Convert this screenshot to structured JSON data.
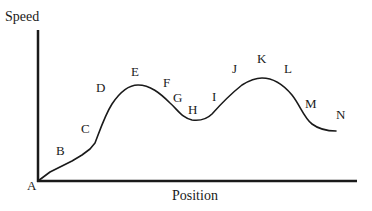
{
  "diagram": {
    "type": "speed-position-curve",
    "axes": {
      "y_label": "Speed",
      "x_label": "Position"
    },
    "colors": {
      "line": "#1a1a1a",
      "background": "#ffffff"
    },
    "points": [
      {
        "label": "A",
        "x": 32,
        "y": 190
      },
      {
        "label": "B",
        "x": 61,
        "y": 155
      },
      {
        "label": "C",
        "x": 87,
        "y": 133
      },
      {
        "label": "D",
        "x": 102,
        "y": 92
      },
      {
        "label": "E",
        "x": 136,
        "y": 76
      },
      {
        "label": "F",
        "x": 167,
        "y": 87
      },
      {
        "label": "G",
        "x": 178,
        "y": 102
      },
      {
        "label": "H",
        "x": 193,
        "y": 114
      },
      {
        "label": "I",
        "x": 214,
        "y": 101
      },
      {
        "label": "J",
        "x": 236,
        "y": 73
      },
      {
        "label": "K",
        "x": 262,
        "y": 63
      },
      {
        "label": "L",
        "x": 289,
        "y": 73
      },
      {
        "label": "M",
        "x": 312,
        "y": 108
      },
      {
        "label": "N",
        "x": 342,
        "y": 119
      }
    ]
  }
}
